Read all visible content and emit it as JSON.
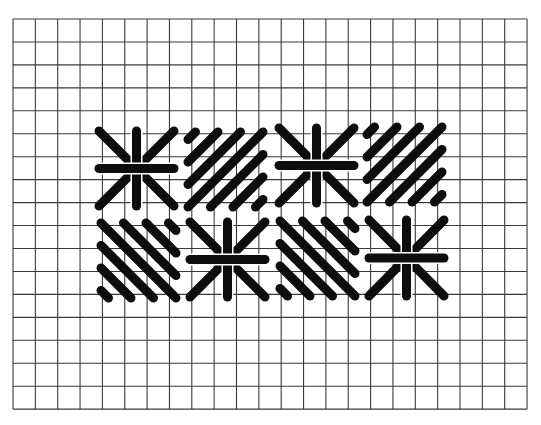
{
  "diagram": {
    "colors": {
      "background": "#ffffff",
      "grid": "#3a3a3a",
      "stitch": "#0d0d0d"
    },
    "canvas_grid": {
      "left": 13,
      "top": 19,
      "columns": 23,
      "rows": 17,
      "cell_width": 22.35,
      "cell_height": 22.95
    },
    "stitch_width": 9,
    "blocks": [
      {
        "name": "star-stitch-top-1",
        "type": "star",
        "x1": 99,
        "y1": 131,
        "x2": 174,
        "y2": 206
      },
      {
        "name": "diagonal-block-top-2",
        "type": "diagonal-up",
        "x1": 188,
        "y1": 132,
        "x2": 263,
        "y2": 207
      },
      {
        "name": "star-stitch-top-3",
        "type": "star",
        "x1": 279,
        "y1": 128,
        "x2": 354,
        "y2": 203
      },
      {
        "name": "diagonal-block-top-4",
        "type": "diagonal-up",
        "x1": 367,
        "y1": 127,
        "x2": 442,
        "y2": 202
      },
      {
        "name": "diagonal-block-bottom-1",
        "type": "diagonal-down",
        "x1": 101,
        "y1": 223,
        "x2": 176,
        "y2": 298
      },
      {
        "name": "star-stitch-bottom-2",
        "type": "star",
        "x1": 190,
        "y1": 222,
        "x2": 265,
        "y2": 297
      },
      {
        "name": "diagonal-block-bottom-3",
        "type": "diagonal-down",
        "x1": 280,
        "y1": 221,
        "x2": 355,
        "y2": 296
      },
      {
        "name": "star-stitch-bottom-4",
        "type": "star",
        "x1": 369,
        "y1": 220,
        "x2": 444,
        "y2": 296
      }
    ]
  }
}
